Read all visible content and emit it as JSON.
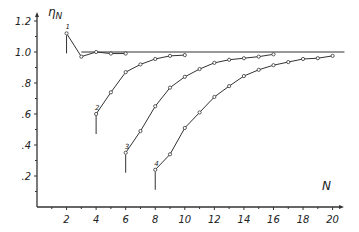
{
  "chart_data": {
    "type": "line",
    "title": "",
    "xlabel": "N",
    "ylabel": "η_N",
    "xlim": [
      0,
      21
    ],
    "ylim": [
      0,
      1.25
    ],
    "x_ticks": [
      2,
      4,
      6,
      8,
      10,
      12,
      14,
      16,
      18,
      20
    ],
    "x_tick_labels": [
      "2",
      "4",
      "6",
      "8",
      "10",
      "12",
      "14",
      "16",
      "18",
      "20"
    ],
    "y_ticks": [
      0.2,
      0.4,
      0.6,
      0.8,
      1.0,
      1.2
    ],
    "y_tick_labels": [
      ".2",
      ".4",
      ".6",
      ".8",
      "1.0",
      "1.2"
    ],
    "grid": false,
    "legend": "none",
    "reference_line": {
      "y": 1.0,
      "x_from": 3,
      "x_to": 20.8
    },
    "series": [
      {
        "name": "1",
        "x": [
          2,
          3,
          4,
          5,
          6
        ],
        "values": [
          1.12,
          0.97,
          1.0,
          0.99,
          0.99
        ]
      },
      {
        "name": "2",
        "x": [
          4,
          5,
          6,
          7,
          8,
          9,
          10
        ],
        "values": [
          0.6,
          0.74,
          0.87,
          0.92,
          0.955,
          0.975,
          0.98
        ]
      },
      {
        "name": "3",
        "x": [
          6,
          7,
          8,
          9,
          10,
          11,
          12,
          13,
          14,
          15,
          16
        ],
        "values": [
          0.35,
          0.49,
          0.65,
          0.77,
          0.84,
          0.89,
          0.93,
          0.95,
          0.96,
          0.97,
          0.985
        ]
      },
      {
        "name": "4",
        "x": [
          8,
          9,
          10,
          11,
          12,
          13,
          14,
          15,
          16,
          17,
          18,
          19,
          20
        ],
        "values": [
          0.24,
          0.34,
          0.51,
          0.61,
          0.71,
          0.78,
          0.845,
          0.885,
          0.915,
          0.935,
          0.955,
          0.96,
          0.975
        ]
      }
    ]
  }
}
